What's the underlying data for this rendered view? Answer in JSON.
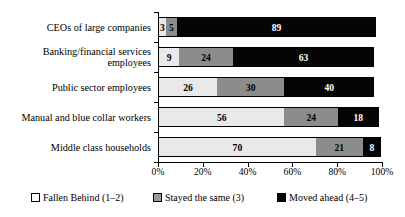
{
  "chart_data": {
    "type": "bar",
    "orientation": "horizontal",
    "stacked": true,
    "title": "",
    "subtitle": "",
    "xlabel": "",
    "ylabel": "",
    "xlim": [
      0,
      100
    ],
    "grid": false,
    "legend_position": "bottom",
    "categories": [
      "CEOs of large companies",
      "Banking/financial services employees",
      "Public sector employees",
      "Manual and blue collar workers",
      "Middle class households"
    ],
    "series": [
      {
        "name": "Fallen Behind (1–2)",
        "color": "#e9e9e9",
        "values": [
          3,
          9,
          26,
          56,
          70
        ]
      },
      {
        "name": "Stayed the same (3)",
        "color": "#8c8c8c",
        "values": [
          5,
          24,
          30,
          24,
          21
        ]
      },
      {
        "name": "Moved ahead (4–5)",
        "color": "#050505",
        "values": [
          89,
          63,
          40,
          18,
          8
        ]
      }
    ],
    "xtick_labels": [
      "0%",
      "20%",
      "40%",
      "60%",
      "80%",
      "100%"
    ],
    "xtick_values": [
      0,
      20,
      40,
      60,
      80,
      100
    ],
    "bar_labels": [
      [
        "3",
        "5",
        "89"
      ],
      [
        "9",
        "24",
        "63"
      ],
      [
        "26",
        "30",
        "40"
      ],
      [
        "56",
        "24",
        "18"
      ],
      [
        "70",
        "21",
        "8"
      ]
    ]
  },
  "legend": {
    "items": [
      {
        "label": "Fallen Behind (1–2)"
      },
      {
        "label": "Stayed the same (3)"
      },
      {
        "label": "Moved ahead (4–5)"
      }
    ]
  }
}
